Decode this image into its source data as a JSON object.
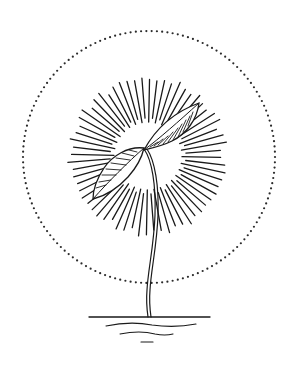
{
  "illustration": {
    "subject": "sprouting seedling with radiant sun burst",
    "elements": {
      "halo": "dotted-circle",
      "sunburst": "radial-rays",
      "plant": "seedling-with-two-leaves",
      "ground": "horizontal-ground-lines"
    },
    "colors": {
      "background": "#ffffff",
      "ink": "#1a1a1a",
      "dots": "#2a2a2a"
    },
    "halo": {
      "cx": 149,
      "cy": 157,
      "r": 126,
      "dot_count": 150
    },
    "sunburst": {
      "cx": 148,
      "cy": 156,
      "inner_r": 34,
      "outer_r": 78,
      "ray_count": 64
    },
    "ground_lines": [
      {
        "d": "M89 317 L210 317",
        "width": 1.3
      },
      {
        "d": "M106 326 Q130 321 152 325 Q175 328 196 324",
        "width": 1.2
      },
      {
        "d": "M120 334 Q140 330 155 334 Q165 336 173 334",
        "width": 1.1
      },
      {
        "d": "M141 342 L153 342",
        "width": 1.1
      }
    ]
  }
}
